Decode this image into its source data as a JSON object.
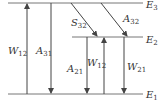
{
  "diagram": {
    "type": "energy-level-diagram",
    "colors": {
      "line": "#555555",
      "text": "#333333",
      "background": "#ffffff"
    },
    "levels": [
      {
        "id": "E3",
        "symbol": "E",
        "sub": "3"
      },
      {
        "id": "E2",
        "symbol": "E",
        "sub": "2"
      },
      {
        "id": "E1",
        "symbol": "E",
        "sub": "1"
      }
    ],
    "transitions": [
      {
        "id": "W12_pump",
        "symbol": "W",
        "sub": "12",
        "from": "E1",
        "to": "E3",
        "direction": "up"
      },
      {
        "id": "A31",
        "symbol": "A",
        "sub": "31",
        "from": "E3",
        "to": "E1",
        "direction": "down"
      },
      {
        "id": "S32",
        "symbol": "S",
        "sub": "32",
        "from": "E3",
        "to": "E2",
        "direction": "down"
      },
      {
        "id": "A32",
        "symbol": "A",
        "sub": "32",
        "from": "E3",
        "to": "E2",
        "direction": "down"
      },
      {
        "id": "A21",
        "symbol": "A",
        "sub": "21",
        "from": "E2",
        "to": "E1",
        "direction": "down"
      },
      {
        "id": "W12",
        "symbol": "W",
        "sub": "12",
        "from": "E1",
        "to": "E2",
        "direction": "up"
      },
      {
        "id": "W21",
        "symbol": "W",
        "sub": "21",
        "from": "E2",
        "to": "E1",
        "direction": "down"
      }
    ]
  }
}
